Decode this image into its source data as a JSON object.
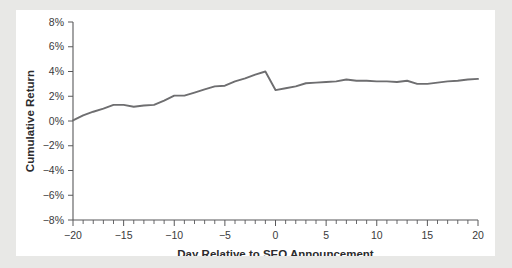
{
  "chart_data": {
    "type": "line",
    "title": "",
    "xlabel": "Day Relative to SEO Announcement",
    "ylabel": "Cumulative Return",
    "xlim": [
      -20,
      20
    ],
    "ylim": [
      -8,
      8
    ],
    "grid": false,
    "legend": false,
    "line_color": "#6e6e70",
    "x_tick_labels": [
      "−20",
      "−15",
      "−10",
      "−5",
      "0",
      "5",
      "10",
      "15",
      "20"
    ],
    "x_tick_values": [
      -20,
      -15,
      -10,
      -5,
      0,
      5,
      10,
      15,
      20
    ],
    "x_minor_tick_step": 1,
    "y_tick_labels": [
      "8%",
      "6%",
      "4%",
      "2%",
      "0%",
      "−2%",
      "−4%",
      "−6%",
      "−8%"
    ],
    "y_tick_values": [
      8,
      6,
      4,
      2,
      0,
      -2,
      -4,
      -6,
      -8
    ],
    "series": [
      {
        "name": "Cumulative Return",
        "x": [
          -20,
          -19,
          -18,
          -17,
          -16,
          -15,
          -14,
          -13,
          -12,
          -11,
          -10,
          -9,
          -8,
          -7,
          -6,
          -5,
          -4,
          -3,
          -2,
          -1,
          0,
          1,
          2,
          3,
          4,
          5,
          6,
          7,
          8,
          9,
          10,
          11,
          12,
          13,
          14,
          15,
          16,
          17,
          18,
          19,
          20
        ],
        "values": [
          0.05,
          0.45,
          0.75,
          1.0,
          1.3,
          1.3,
          1.15,
          1.25,
          1.3,
          1.65,
          2.05,
          2.05,
          2.3,
          2.55,
          2.8,
          2.85,
          3.2,
          3.45,
          3.75,
          4.0,
          2.5,
          2.65,
          2.8,
          3.05,
          3.1,
          3.15,
          3.2,
          3.35,
          3.25,
          3.25,
          3.2,
          3.2,
          3.15,
          3.25,
          3.0,
          3.0,
          3.1,
          3.2,
          3.25,
          3.35,
          3.4
        ]
      }
    ]
  },
  "figure": {
    "background": "#ffffff",
    "page_background": "#e8e8e6"
  }
}
